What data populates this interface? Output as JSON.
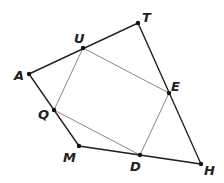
{
  "diagram": {
    "points": {
      "T": {
        "x": 138,
        "y": 23,
        "label": "T",
        "lx": 142,
        "ly": 22
      },
      "U": {
        "x": 83,
        "y": 48,
        "label": "U",
        "lx": 74,
        "ly": 43
      },
      "A": {
        "x": 29,
        "y": 74,
        "label": "A",
        "lx": 14,
        "ly": 80
      },
      "E": {
        "x": 169,
        "y": 93,
        "label": "E",
        "lx": 171,
        "ly": 91
      },
      "Q": {
        "x": 54,
        "y": 110,
        "label": "Q",
        "lx": 38,
        "ly": 119
      },
      "M": {
        "x": 79,
        "y": 146,
        "label": "M",
        "lx": 63,
        "ly": 162
      },
      "D": {
        "x": 140,
        "y": 155,
        "label": "D",
        "lx": 130,
        "ly": 171
      },
      "H": {
        "x": 201,
        "y": 164,
        "label": "H",
        "lx": 204,
        "ly": 175
      }
    },
    "outer_polygon": [
      "A",
      "T",
      "H",
      "M"
    ],
    "inner_quadrilateral": [
      "U",
      "E",
      "D",
      "Q"
    ],
    "colors": {
      "outer": "#222222",
      "inner": "#888888",
      "point": "#111111"
    }
  }
}
